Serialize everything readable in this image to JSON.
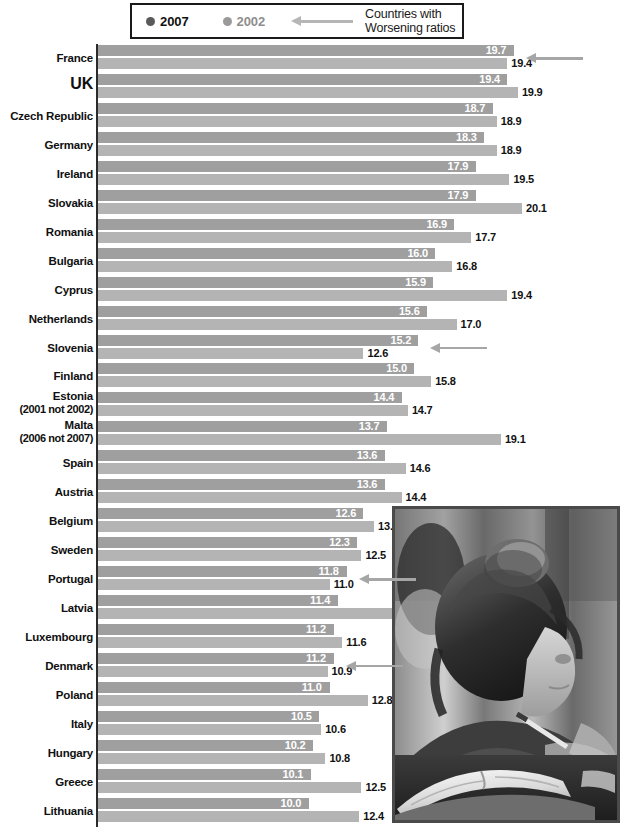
{
  "legend": {
    "series_2007": {
      "label": "2007",
      "color": "#5a5a5a"
    },
    "series_2002": {
      "label": "2002",
      "color": "#9a9a9a"
    },
    "arrow_icon": "arrow-left-icon",
    "note_line1": "Countries with",
    "note_line2": "Worsening ratios"
  },
  "photo": {
    "alt": "schoolgirl-writing-photo"
  },
  "chart_data": {
    "type": "bar",
    "orientation": "horizontal",
    "title": "",
    "subtitle": "",
    "xlabel": "",
    "ylabel": "",
    "xlim": [
      0,
      20.6
    ],
    "grid": false,
    "legend_position": "top",
    "legend_entries": [
      "2007",
      "2002"
    ],
    "annotations": [
      "Countries with Worsening ratios (arrows mark France, Slovenia, Portugal, Denmark)"
    ],
    "categories": [
      "France",
      "UK",
      "Czech Republic",
      "Germany",
      "Ireland",
      "Slovakia",
      "Romania",
      "Bulgaria",
      "Cyprus",
      "Netherlands",
      "Slovenia",
      "Finland",
      "Estonia",
      "Malta",
      "Spain",
      "Austria",
      "Belgium",
      "Sweden",
      "Portugal",
      "Latvia",
      "Luxembourg",
      "Denmark",
      "Poland",
      "Italy",
      "Hungary",
      "Greece",
      "Lithuania"
    ],
    "category_notes": {
      "Estonia": "(2001 not 2002)",
      "Malta": "(2006 not 2007)"
    },
    "series": [
      {
        "name": "2007",
        "color": "#9f9f9f",
        "values": [
          19.7,
          19.4,
          18.7,
          18.3,
          17.9,
          17.9,
          16.9,
          16.0,
          15.9,
          15.6,
          15.2,
          15.0,
          14.4,
          13.7,
          13.6,
          13.6,
          12.6,
          12.3,
          11.8,
          11.4,
          11.2,
          11.2,
          11.0,
          10.5,
          10.2,
          10.1,
          10.0
        ]
      },
      {
        "name": "2002",
        "color": "#b4b4b4",
        "values": [
          19.4,
          19.9,
          18.9,
          18.9,
          19.5,
          20.1,
          17.7,
          16.8,
          19.4,
          17.0,
          12.6,
          15.8,
          14.7,
          19.1,
          14.6,
          14.4,
          13.1,
          12.5,
          11.0,
          16.9,
          11.6,
          10.9,
          12.8,
          10.6,
          10.8,
          12.5,
          12.4
        ]
      }
    ],
    "worsening_arrow_rows": [
      "France",
      "Slovenia",
      "Portugal",
      "Denmark"
    ]
  }
}
